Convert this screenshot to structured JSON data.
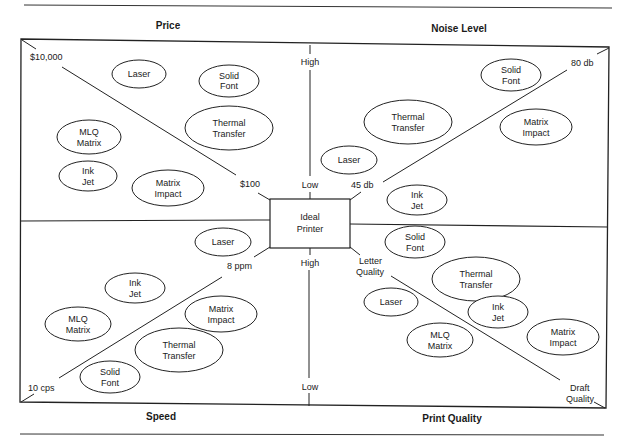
{
  "diagram": {
    "center": {
      "label_line1": "Ideal",
      "label_line2": "Printer"
    },
    "quadrants": [
      {
        "id": "price",
        "title": "Price",
        "axis_high_label": "$10,000",
        "axis_low_label": "$100",
        "items": [
          {
            "line1": "Laser",
            "line2": ""
          },
          {
            "line1": "Solid",
            "line2": "Font"
          },
          {
            "line1": "Thermal",
            "line2": "Transfer"
          },
          {
            "line1": "MLQ",
            "line2": "Matrix"
          },
          {
            "line1": "Ink",
            "line2": "Jet"
          },
          {
            "line1": "Matrix",
            "line2": "Impact"
          }
        ]
      },
      {
        "id": "noise",
        "title": "Noise Level",
        "axis_high_label": "80 db",
        "axis_low_label": "45 db",
        "items": [
          {
            "line1": "Solid",
            "line2": "Font"
          },
          {
            "line1": "Thermal",
            "line2": "Transfer"
          },
          {
            "line1": "Matrix",
            "line2": "Impact"
          },
          {
            "line1": "Laser",
            "line2": ""
          },
          {
            "line1": "Ink",
            "line2": "Jet"
          }
        ]
      },
      {
        "id": "speed",
        "title": "Speed",
        "axis_high_label": "8 ppm",
        "axis_low_label": "10 cps",
        "items": [
          {
            "line1": "Laser",
            "line2": ""
          },
          {
            "line1": "Ink",
            "line2": "Jet"
          },
          {
            "line1": "MLQ",
            "line2": "Matrix"
          },
          {
            "line1": "Matrix",
            "line2": "Impact"
          },
          {
            "line1": "Thermal",
            "line2": "Transfer"
          },
          {
            "line1": "Solid",
            "line2": "Font"
          }
        ]
      },
      {
        "id": "print_quality",
        "title": "Print Quality",
        "axis_high_label_line1": "Letter",
        "axis_high_label_line2": "Quality",
        "axis_low_label_line1": "Draft",
        "axis_low_label_line2": "Quality",
        "items": [
          {
            "line1": "Solid",
            "line2": "Font"
          },
          {
            "line1": "Thermal",
            "line2": "Transfer"
          },
          {
            "line1": "Laser",
            "line2": ""
          },
          {
            "line1": "Ink",
            "line2": "Jet"
          },
          {
            "line1": "MLQ",
            "line2": "Matrix"
          },
          {
            "line1": "Matrix",
            "line2": "Impact"
          }
        ]
      }
    ],
    "vertical_axis": {
      "top_high": "High",
      "top_low": "Low",
      "bottom_high": "High",
      "bottom_low": "Low"
    }
  }
}
